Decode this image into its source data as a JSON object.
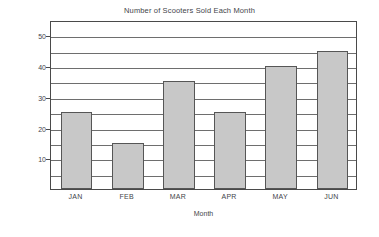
{
  "chart_data": {
    "type": "bar",
    "title": "Number of Scooters Sold Each Month",
    "xlabel": "Month",
    "ylabel": "Number of Scooters",
    "categories": [
      "JAN",
      "FEB",
      "MAR",
      "APR",
      "MAY",
      "JUN"
    ],
    "values": [
      25,
      15,
      35,
      25,
      40,
      45
    ],
    "ylim": [
      0,
      55
    ],
    "ytick_labels": [
      "10",
      "20",
      "30",
      "40",
      "50"
    ],
    "ytick_values": [
      10,
      20,
      30,
      40,
      50
    ],
    "gridline_values": [
      5,
      10,
      15,
      20,
      25,
      30,
      35,
      40,
      45,
      50
    ],
    "grid": "horizontal",
    "legend": "none",
    "bar_color": "#c8c8c8",
    "bar_edge_color": "#565656",
    "axis_color": "#4a4a4a",
    "background_color": "#ffffff"
  }
}
